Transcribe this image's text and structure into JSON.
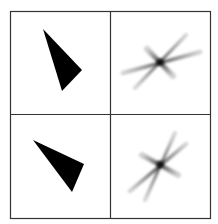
{
  "figure": {
    "background": "#ffffff",
    "border_color": "#333333",
    "fill_color": "#000000",
    "grid": {
      "rows": 2,
      "cols": 2,
      "left": 10,
      "top": 11,
      "right": 210,
      "bottom": 218,
      "col_divider_x": 110,
      "row_divider_y": 114
    },
    "panels": [
      {
        "id": "top-left",
        "type": "triangle",
        "points": [
          [
            43,
            29
          ],
          [
            82,
            70
          ],
          [
            62,
            91
          ]
        ]
      },
      {
        "id": "top-right",
        "type": "star-spectrum",
        "center": [
          160,
          62
        ],
        "arms": [
          {
            "from": [
              123,
              73
            ],
            "to": [
              200,
              52
            ],
            "width": 3.2,
            "opacity": 0.55
          },
          {
            "from": [
              135,
              88
            ],
            "to": [
              186,
              35
            ],
            "width": 2.8,
            "opacity": 0.5
          },
          {
            "from": [
              147,
              49
            ],
            "to": [
              173,
              76
            ],
            "width": 4.0,
            "opacity": 0.6
          }
        ]
      },
      {
        "id": "bottom-left",
        "type": "triangle",
        "points": [
          [
            33,
            140
          ],
          [
            84,
            164
          ],
          [
            72,
            192
          ]
        ]
      },
      {
        "id": "bottom-right",
        "type": "star-spectrum",
        "center": [
          160,
          164
        ],
        "arms": [
          {
            "from": [
              145,
              200
            ],
            "to": [
              175,
              133
            ],
            "width": 2.8,
            "opacity": 0.5
          },
          {
            "from": [
              130,
              191
            ],
            "to": [
              186,
              144
            ],
            "width": 3.0,
            "opacity": 0.55
          },
          {
            "from": [
              142,
              155
            ],
            "to": [
              178,
              175
            ],
            "width": 4.0,
            "opacity": 0.6
          }
        ]
      }
    ]
  }
}
